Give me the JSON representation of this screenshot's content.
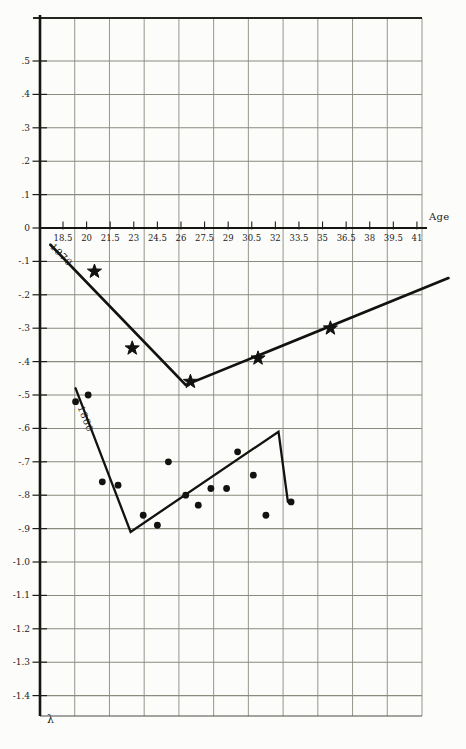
{
  "colors": {
    "ink": "#1c1c1a",
    "grid": "#8a8a80",
    "frame": "#4a4a44",
    "paper": "#fcfcfa"
  },
  "chart_data": {
    "type": "scatter",
    "title": "",
    "xlabel": "Age",
    "ylabel": "λ",
    "xlim": [
      17.2,
      42.5
    ],
    "ylim": [
      -1.46,
      0.62
    ],
    "grid": true,
    "x_tick_step": 1.5,
    "y_tick_step": 0.1,
    "x_tick_labels": [
      "18.5",
      "20",
      "21.5",
      "23",
      "24.5",
      "26",
      "27.5",
      "29",
      "30.5",
      "32",
      "33.5",
      "35",
      "36.5",
      "38",
      "39.5",
      "41"
    ],
    "x_tick_values": [
      18.5,
      20,
      21.5,
      23,
      24.5,
      26,
      27.5,
      29,
      30.5,
      32,
      33.5,
      35,
      36.5,
      38,
      39.5,
      41
    ],
    "y_tick_labels": [
      ".5",
      ".4",
      ".3",
      ".2",
      ".1",
      "0",
      "-.1",
      "-.2",
      "-.3",
      "-.4",
      "-.5",
      "-.6",
      "-.7",
      "-.8",
      "-.9",
      "-1.0",
      "-1.1",
      "-1.2",
      "-1.3",
      "-1.4"
    ],
    "series": [
      {
        "name": "1970",
        "marker": "star",
        "points": [
          [
            20.5,
            -0.13
          ],
          [
            22.9,
            -0.36
          ],
          [
            26.6,
            -0.46
          ],
          [
            30.9,
            -0.39
          ],
          [
            35.5,
            -0.3
          ]
        ],
        "trend_line": [
          [
            17.7,
            -0.05
          ],
          [
            26.3,
            -0.47
          ],
          [
            43.0,
            -0.15
          ]
        ]
      },
      {
        "name": "1860",
        "marker": "dot",
        "points": [
          [
            19.3,
            -0.52
          ],
          [
            20.1,
            -0.5
          ],
          [
            21.0,
            -0.76
          ],
          [
            22.0,
            -0.77
          ],
          [
            23.6,
            -0.86
          ],
          [
            24.5,
            -0.89
          ],
          [
            25.2,
            -0.7
          ],
          [
            26.3,
            -0.8
          ],
          [
            27.1,
            -0.83
          ],
          [
            27.9,
            -0.78
          ],
          [
            28.9,
            -0.78
          ],
          [
            29.6,
            -0.67
          ],
          [
            30.6,
            -0.74
          ],
          [
            31.4,
            -0.86
          ],
          [
            33.0,
            -0.82
          ]
        ],
        "trend_line": [
          [
            19.3,
            -0.48
          ],
          [
            22.8,
            -0.91
          ],
          [
            32.2,
            -0.61
          ],
          [
            32.8,
            -0.82
          ]
        ]
      }
    ],
    "layout": {
      "width": 466,
      "height": 749,
      "plot_left": 40,
      "plot_right": 422,
      "plot_top": 18,
      "plot_bottom": 716,
      "n_grid_cols": 11,
      "x_origin_age": 18.5,
      "x_origin_px": 63,
      "px_per_year": 15.73,
      "y_zero_px": 228,
      "px_per_unit": 334,
      "label_1970_px": [
        56,
        241
      ],
      "label_1860_px": [
        86,
        404
      ],
      "xlabel_px": [
        429,
        211
      ],
      "ylabel_px": [
        47,
        713
      ]
    }
  }
}
